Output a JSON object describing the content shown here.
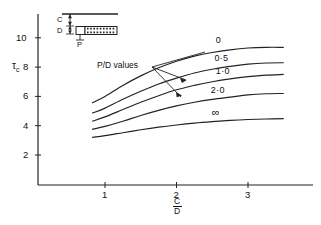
{
  "figure": {
    "annotation_label": "P/D values",
    "inset": {
      "label_c": "C",
      "label_d": "D",
      "label_p": "P"
    }
  },
  "chart_data": {
    "type": "line",
    "title": "",
    "xlabel_numerator": "C",
    "xlabel_denominator": "D",
    "ylabel": "τ",
    "ylabel_sub": "c",
    "xlim": [
      0,
      3.65
    ],
    "ylim": [
      0,
      11.2
    ],
    "xticks": [
      1,
      2,
      3
    ],
    "xticklabels": [
      "1",
      "2",
      "3"
    ],
    "yticks": [
      2,
      4,
      6,
      8,
      10
    ],
    "yticklabels": [
      "2",
      "4",
      "6",
      "8",
      "10"
    ],
    "grid": false,
    "legend_position": "inline-curve-labels",
    "legend_title": "P/D values",
    "series": [
      {
        "name": "0",
        "label": "0",
        "x": [
          0.82,
          1.0,
          1.25,
          1.5,
          1.75,
          2.0,
          2.25,
          2.5,
          2.75,
          3.0,
          3.25,
          3.5
        ],
        "values": [
          5.55,
          6.0,
          6.75,
          7.4,
          7.95,
          8.4,
          8.75,
          9.0,
          9.18,
          9.3,
          9.35,
          9.35
        ]
      },
      {
        "name": "0.5",
        "label": "0·5",
        "x": [
          0.82,
          1.0,
          1.25,
          1.5,
          1.75,
          2.0,
          2.25,
          2.5,
          2.75,
          3.0,
          3.25,
          3.5
        ],
        "values": [
          4.85,
          5.2,
          5.8,
          6.35,
          6.85,
          7.25,
          7.6,
          7.85,
          8.05,
          8.2,
          8.28,
          8.3
        ]
      },
      {
        "name": "1.0",
        "label": "1·0",
        "x": [
          0.82,
          1.0,
          1.25,
          1.5,
          1.75,
          2.0,
          2.25,
          2.5,
          2.75,
          3.0,
          3.25,
          3.5
        ],
        "values": [
          4.3,
          4.6,
          5.1,
          5.6,
          6.05,
          6.45,
          6.75,
          7.0,
          7.2,
          7.35,
          7.45,
          7.5
        ]
      },
      {
        "name": "2.0",
        "label": "2·0",
        "x": [
          0.82,
          1.0,
          1.25,
          1.5,
          1.75,
          2.0,
          2.25,
          2.5,
          2.75,
          3.0,
          3.25,
          3.5
        ],
        "values": [
          3.75,
          3.95,
          4.3,
          4.7,
          5.05,
          5.35,
          5.6,
          5.8,
          5.95,
          6.1,
          6.18,
          6.2
        ]
      },
      {
        "name": "infinity",
        "label": "∞",
        "x": [
          0.82,
          1.0,
          1.25,
          1.5,
          1.75,
          2.0,
          2.25,
          2.5,
          2.75,
          3.0,
          3.25,
          3.5
        ],
        "values": [
          3.2,
          3.32,
          3.52,
          3.72,
          3.9,
          4.05,
          4.18,
          4.28,
          4.36,
          4.42,
          4.46,
          4.48
        ]
      }
    ]
  }
}
